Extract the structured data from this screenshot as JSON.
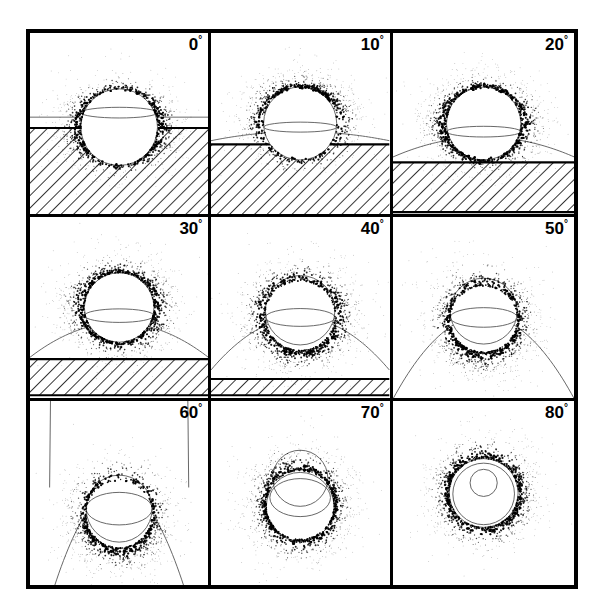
{
  "figure": {
    "type": "scientific-figure",
    "border_color": "#000000",
    "background_color": "#ffffff",
    "point_color": "#000000",
    "curve_color": "#555555",
    "hatch_color": "#000000",
    "grid": {
      "rows": 3,
      "columns": 3
    },
    "degree_symbol": "°"
  },
  "chart_data": {
    "type": "scatter",
    "title": "",
    "xlabel": "",
    "ylabel": "",
    "grid": false,
    "legend_position": "none",
    "panel_labels": [
      "0",
      "10",
      "20",
      "30",
      "40",
      "50",
      "60",
      "70",
      "80"
    ],
    "panels": [
      {
        "label": "0",
        "label_units": "°",
        "angle_deg": 0,
        "circle": {
          "cx": 0.5,
          "cy": 0.52,
          "r": 0.215
        },
        "inner_ellipse": {
          "cx": 0.5,
          "cy": 0.44,
          "rx": 0.215,
          "ry": 0.03
        },
        "curve_type": "horizontal-line",
        "curve_apex_y": 0.465,
        "curve_depth": 0.0,
        "hatch_band": {
          "present": true,
          "top": 0.525,
          "bottom": 1.0
        },
        "cloud": {
          "cx": 0.5,
          "cy": 0.52,
          "rx": 0.3,
          "ry": 0.255,
          "n": 900,
          "spread": 0.11,
          "lobes": "equatorial"
        }
      },
      {
        "label": "10",
        "label_units": "°",
        "angle_deg": 10,
        "circle": {
          "cx": 0.5,
          "cy": 0.5,
          "r": 0.205
        },
        "inner_ellipse": {
          "cx": 0.5,
          "cy": 0.52,
          "rx": 0.205,
          "ry": 0.028
        },
        "curve_type": "shallow-parabola",
        "curve_apex_y": 0.545,
        "curve_depth": 0.05,
        "hatch_band": {
          "present": true,
          "top": 0.615,
          "bottom": 1.0
        },
        "cloud": {
          "cx": 0.5,
          "cy": 0.5,
          "rx": 0.3,
          "ry": 0.255,
          "n": 900,
          "spread": 0.11,
          "lobes": "upper-arc"
        }
      },
      {
        "label": "20",
        "label_units": "°",
        "angle_deg": 20,
        "circle": {
          "cx": 0.5,
          "cy": 0.5,
          "r": 0.205
        },
        "inner_ellipse": {
          "cx": 0.5,
          "cy": 0.545,
          "rx": 0.205,
          "ry": 0.03
        },
        "curve_type": "parabola",
        "curve_apex_y": 0.575,
        "curve_depth": 0.11,
        "hatch_band": {
          "present": true,
          "top": 0.715,
          "bottom": 0.99
        },
        "cloud": {
          "cx": 0.5,
          "cy": 0.5,
          "rx": 0.315,
          "ry": 0.265,
          "n": 980,
          "spread": 0.11,
          "lobes": "ring"
        }
      },
      {
        "label": "30",
        "label_units": "°",
        "angle_deg": 30,
        "circle": {
          "cx": 0.5,
          "cy": 0.5,
          "r": 0.195
        },
        "inner_ellipse": {
          "cx": 0.5,
          "cy": 0.545,
          "rx": 0.195,
          "ry": 0.038
        },
        "curve_type": "parabola",
        "curve_apex_y": 0.585,
        "curve_depth": 0.19,
        "hatch_band": {
          "present": true,
          "top": 0.785,
          "bottom": 0.985
        },
        "cloud": {
          "cx": 0.5,
          "cy": 0.5,
          "rx": 0.305,
          "ry": 0.275,
          "n": 980,
          "spread": 0.115,
          "lobes": "ring"
        }
      },
      {
        "label": "40",
        "label_units": "°",
        "angle_deg": 40,
        "circle": {
          "cx": 0.5,
          "cy": 0.515,
          "r": 0.195
        },
        "inner_ellipse": {
          "cx": 0.5,
          "cy": 0.555,
          "rx": 0.195,
          "ry": 0.05
        },
        "curve_type": "parabola",
        "curve_apex_y": 0.555,
        "curve_depth": 0.29,
        "hatch_band": {
          "present": true,
          "top": 0.895,
          "bottom": 0.985
        },
        "cloud": {
          "cx": 0.5,
          "cy": 0.545,
          "rx": 0.305,
          "ry": 0.295,
          "n": 980,
          "spread": 0.115,
          "lobes": "ring-teardrop"
        }
      },
      {
        "label": "50",
        "label_units": "°",
        "angle_deg": 50,
        "circle": {
          "cx": 0.5,
          "cy": 0.52,
          "r": 0.185
        },
        "inner_ellipse": {
          "cx": 0.5,
          "cy": 0.555,
          "rx": 0.185,
          "ry": 0.055
        },
        "curve_type": "parabola",
        "curve_apex_y": 0.545,
        "curve_depth": 0.46,
        "hatch_band": {
          "present": false,
          "top": 0,
          "bottom": 0
        },
        "cloud": {
          "cx": 0.5,
          "cy": 0.565,
          "rx": 0.305,
          "ry": 0.325,
          "n": 1000,
          "spread": 0.12,
          "lobes": "ring-teardrop"
        }
      },
      {
        "label": "60",
        "label_units": "°",
        "angle_deg": 60,
        "circle": {
          "cx": 0.5,
          "cy": 0.585,
          "r": 0.185
        },
        "inner_ellipse": {
          "cx": 0.5,
          "cy": 0.585,
          "rx": 0.185,
          "ry": 0.09
        },
        "curve_type": "closed-loop",
        "curve_apex_y": 0.47,
        "curve_depth": 0.62,
        "hatch_band": {
          "present": false,
          "top": 0,
          "bottom": 0
        },
        "cloud": {
          "cx": 0.5,
          "cy": 0.615,
          "rx": 0.295,
          "ry": 0.315,
          "n": 1000,
          "spread": 0.12,
          "lobes": "lower-ring"
        }
      },
      {
        "label": "70",
        "label_units": "°",
        "angle_deg": 70,
        "circle": {
          "cx": 0.5,
          "cy": 0.575,
          "r": 0.19
        },
        "inner_ellipse": {
          "cx": 0.5,
          "cy": 0.525,
          "rx": 0.17,
          "ry": 0.105
        },
        "curve_type": "second-circle",
        "second_circle": {
          "cx": 0.5,
          "cy": 0.42,
          "r": 0.155
        },
        "curve_apex_y": 0.265,
        "curve_depth": 0.0,
        "hatch_band": {
          "present": false,
          "top": 0,
          "bottom": 0
        },
        "cloud": {
          "cx": 0.5,
          "cy": 0.565,
          "rx": 0.29,
          "ry": 0.315,
          "n": 1000,
          "spread": 0.115,
          "lobes": "ring"
        }
      },
      {
        "label": "80",
        "label_units": "°",
        "angle_deg": 80,
        "circle": {
          "cx": 0.5,
          "cy": 0.5,
          "r": 0.19
        },
        "inner_ellipse": {
          "cx": 0.5,
          "cy": 0.505,
          "rx": 0.17,
          "ry": 0.17
        },
        "curve_type": "concentric-circle",
        "second_circle": {
          "cx": 0.5,
          "cy": 0.445,
          "r": 0.075
        },
        "curve_apex_y": 0.37,
        "curve_depth": 0.0,
        "hatch_band": {
          "present": false,
          "top": 0,
          "bottom": 0
        },
        "cloud": {
          "cx": 0.5,
          "cy": 0.5,
          "rx": 0.28,
          "ry": 0.29,
          "n": 900,
          "spread": 0.105,
          "lobes": "ring"
        }
      }
    ]
  }
}
